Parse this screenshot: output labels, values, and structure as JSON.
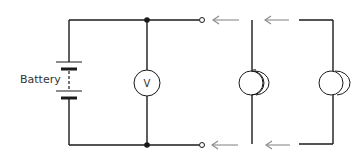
{
  "diagram": {
    "type": "circuit",
    "battery_label": "Battery",
    "voltmeter_label": "V",
    "components": [
      {
        "name": "battery",
        "label": "Battery"
      },
      {
        "name": "voltmeter",
        "label": "V"
      },
      {
        "name": "open-terminals",
        "count": 2
      },
      {
        "name": "lamp-1",
        "kind": "lamp with straight leads"
      },
      {
        "name": "lamp-2",
        "kind": "lamp with bent leads"
      }
    ],
    "arrows": {
      "direction": "left",
      "count": 4
    },
    "colors": {
      "wire": "#1a1a1a",
      "arrow": "#8a8a8a",
      "background": "#ffffff"
    }
  }
}
